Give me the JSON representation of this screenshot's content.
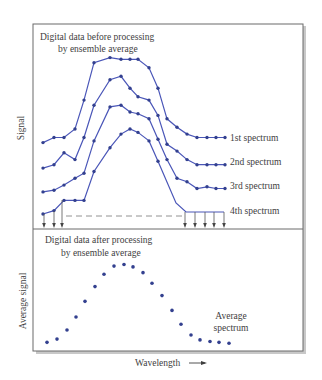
{
  "top_panel": {
    "title_line1": "Digital data before processing",
    "title_line2": "by ensemble average",
    "y_label": "Signal",
    "spectra": [
      {
        "label": "1st spectrum",
        "values": [
          0.42,
          0.45,
          0.45,
          0.5,
          0.67,
          0.89,
          0.92,
          0.91,
          0.91,
          0.91,
          0.86,
          0.74,
          0.56,
          0.51,
          0.47,
          0.45,
          0.45,
          0.45,
          0.45
        ]
      },
      {
        "label": "2nd spectrum",
        "values": [
          0.27,
          0.29,
          0.36,
          0.32,
          0.45,
          0.64,
          0.79,
          0.81,
          0.74,
          0.69,
          0.67,
          0.58,
          0.41,
          0.37,
          0.32,
          0.29,
          0.29,
          0.29,
          0.29
        ]
      },
      {
        "label": "3rd spectrum",
        "values": [
          0.13,
          0.14,
          0.17,
          0.21,
          0.24,
          0.43,
          0.63,
          0.64,
          0.6,
          0.59,
          0.56,
          0.44,
          0.32,
          0.21,
          0.19,
          0.15,
          0.16,
          0.15,
          0.15
        ]
      },
      {
        "label": "4th spectrum",
        "values": [
          0.0,
          0.02,
          0.08,
          0.08,
          0.08,
          0.25,
          0.39,
          0.47,
          0.5,
          0.48,
          0.43,
          0.31
        ]
      }
    ]
  },
  "bottom_panel": {
    "title_line1": "Digital data after processing",
    "title_line2": "by ensemble average",
    "y_label": "Average signal",
    "series_label_line1": "Average",
    "series_label_line2": "spectrum",
    "values": [
      0.02,
      0.06,
      0.17,
      0.33,
      0.52,
      0.7,
      0.85,
      0.95,
      0.97,
      0.94,
      0.87,
      0.74,
      0.59,
      0.41,
      0.24,
      0.11,
      0.05,
      0.03,
      0.02,
      0.01
    ]
  },
  "x_label": "Wavelength",
  "colors": {
    "line": "#4a56b8",
    "dot": "#33408f",
    "frame": "#666666",
    "text": "#3e3e3e"
  }
}
